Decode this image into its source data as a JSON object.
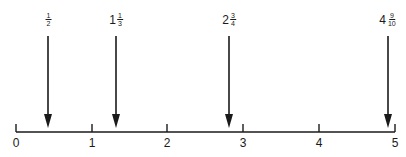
{
  "diagram": {
    "type": "number-line",
    "axis": {
      "min": 0,
      "max": 5,
      "ticks": [
        "0",
        "1",
        "2",
        "3",
        "4",
        "5"
      ]
    },
    "markers": [
      {
        "whole": "",
        "numerator": "1",
        "denominator": "2",
        "value": 0.5,
        "text": "1/2"
      },
      {
        "whole": "1",
        "numerator": "1",
        "denominator": "3",
        "value": 1.333,
        "text": "1 1/3"
      },
      {
        "whole": "2",
        "numerator": "3",
        "denominator": "4",
        "value": 2.75,
        "text": "2 3/4"
      },
      {
        "whole": "4",
        "numerator": "9",
        "denominator": "10",
        "value": 4.9,
        "text": "4 9/10"
      }
    ],
    "colors": {
      "line": "#1a1a1a",
      "background": "#ffffff"
    }
  }
}
